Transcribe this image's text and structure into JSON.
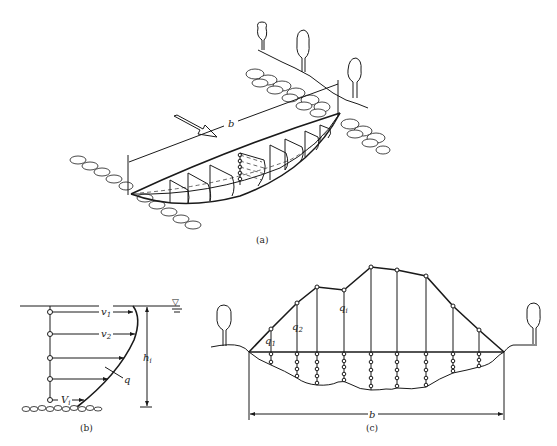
{
  "figure": {
    "panels": [
      {
        "id": "a",
        "caption": "(a)",
        "description": "Isometric view of river cross-section with verticals and velocity profiles",
        "width_label": "b"
      },
      {
        "id": "b",
        "caption": "(b)",
        "description": "Vertical velocity profile at a single vertical",
        "labels": {
          "v1": "v",
          "v1_sub": "1",
          "v2": "v",
          "v2_sub": "2",
          "q": "q",
          "h": "h",
          "h_sub": "i",
          "vbottom": "V",
          "vbottom_sub": "i"
        },
        "water_surface_symbol": "▽"
      },
      {
        "id": "c",
        "caption": "(c)",
        "description": "Cross-section with unit discharge distribution curve",
        "width_label": "b",
        "labels": {
          "q1": "q",
          "q1_sub": "1",
          "q2": "q",
          "q2_sub": "2",
          "qi": "q",
          "qi_sub": "i"
        },
        "verticals": [
          {
            "x": 271,
            "top_y": 329,
            "bottom_y": 365,
            "points": 2
          },
          {
            "x": 297,
            "top_y": 303,
            "bottom_y": 378,
            "points": 4
          },
          {
            "x": 317,
            "top_y": 287,
            "bottom_y": 385,
            "points": 5
          },
          {
            "x": 344,
            "top_y": 290,
            "bottom_y": 382,
            "points": 5
          },
          {
            "x": 371,
            "top_y": 267,
            "bottom_y": 390,
            "points": 5
          },
          {
            "x": 397,
            "top_y": 270,
            "bottom_y": 388,
            "points": 5
          },
          {
            "x": 426,
            "top_y": 276,
            "bottom_y": 387,
            "points": 5
          },
          {
            "x": 453,
            "top_y": 306,
            "bottom_y": 373,
            "points": 4
          },
          {
            "x": 479,
            "top_y": 330,
            "bottom_y": 367,
            "points": 3
          }
        ]
      }
    ]
  }
}
